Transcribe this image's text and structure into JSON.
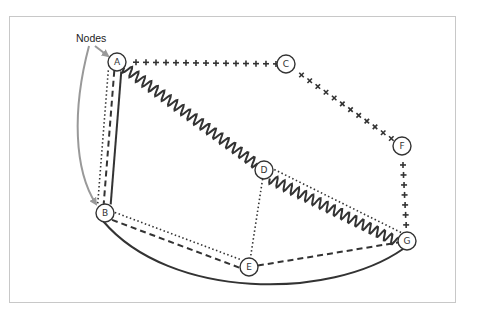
{
  "annotation": {
    "label": "Nodes"
  },
  "nodes": [
    {
      "id": "A",
      "x": 117,
      "y": 62
    },
    {
      "id": "B",
      "x": 105,
      "y": 213
    },
    {
      "id": "C",
      "x": 286,
      "y": 64
    },
    {
      "id": "D",
      "x": 264,
      "y": 170
    },
    {
      "id": "E",
      "x": 249,
      "y": 267
    },
    {
      "id": "F",
      "x": 402,
      "y": 146
    },
    {
      "id": "G",
      "x": 407,
      "y": 241
    }
  ],
  "edges": [
    {
      "from": "A",
      "to": "C",
      "style": "plus"
    },
    {
      "from": "C",
      "to": "F",
      "style": "cross"
    },
    {
      "from": "F",
      "to": "G",
      "style": "plus"
    },
    {
      "from": "A",
      "to": "D",
      "style": "wavy"
    },
    {
      "from": "D",
      "to": "G",
      "style": "wavy"
    },
    {
      "from": "D",
      "to": "G",
      "style": "dotted"
    },
    {
      "from": "D",
      "to": "E",
      "style": "dotted"
    },
    {
      "from": "A",
      "to": "B",
      "style": "solid"
    },
    {
      "from": "A",
      "to": "B",
      "style": "dashed"
    },
    {
      "from": "A",
      "to": "B",
      "style": "dotted"
    },
    {
      "from": "B",
      "to": "E",
      "style": "dotted"
    },
    {
      "from": "B",
      "to": "E",
      "style": "dashed"
    },
    {
      "from": "E",
      "to": "G",
      "style": "dashed"
    },
    {
      "from": "B",
      "to": "G",
      "style": "solid-curve"
    }
  ],
  "colors": {
    "stroke": "#333333",
    "arrow": "#999999",
    "frame": "#c8c8c8"
  }
}
